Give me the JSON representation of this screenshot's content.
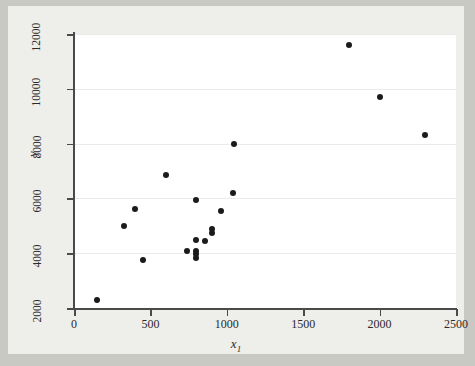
{
  "chart_data": {
    "type": "scatter",
    "title": "",
    "xlabel": "x1",
    "ylabel": "y",
    "xlim": [
      0,
      2500
    ],
    "ylim": [
      2000,
      12000
    ],
    "xticks": [
      0,
      500,
      1000,
      1500,
      2000,
      2500
    ],
    "yticks": [
      2000,
      4000,
      6000,
      8000,
      10000,
      12000
    ],
    "xtick_labels": [
      "0",
      "500",
      "1000",
      "1500",
      "2000",
      "2500"
    ],
    "ytick_labels": [
      "2000",
      "4000",
      "6000",
      "8000",
      "10000",
      "12000"
    ],
    "grid": true,
    "legend": null,
    "marker": "filled-circle",
    "marker_color": "#1b1b1b",
    "points": [
      {
        "x": 150,
        "y": 2300
      },
      {
        "x": 330,
        "y": 5000
      },
      {
        "x": 400,
        "y": 5600
      },
      {
        "x": 450,
        "y": 3750
      },
      {
        "x": 600,
        "y": 6850
      },
      {
        "x": 740,
        "y": 4100
      },
      {
        "x": 800,
        "y": 5950
      },
      {
        "x": 800,
        "y": 4500
      },
      {
        "x": 800,
        "y": 4080
      },
      {
        "x": 800,
        "y": 3960
      },
      {
        "x": 800,
        "y": 3840
      },
      {
        "x": 860,
        "y": 4450
      },
      {
        "x": 900,
        "y": 4750
      },
      {
        "x": 900,
        "y": 4880
      },
      {
        "x": 960,
        "y": 5550
      },
      {
        "x": 1040,
        "y": 6200
      },
      {
        "x": 1050,
        "y": 8000
      },
      {
        "x": 1800,
        "y": 11600
      },
      {
        "x": 2000,
        "y": 9700
      },
      {
        "x": 2300,
        "y": 8300
      }
    ]
  },
  "figure": {
    "background_color": "#c9c9c4",
    "paper_color": "#eeeeea",
    "plot_color": "#ffffff",
    "axis_color": "#4a4a4a",
    "grid_color": "#ecebe8"
  },
  "axis_labels": {
    "x_base": "x",
    "x_sub": "1",
    "y": "y"
  }
}
